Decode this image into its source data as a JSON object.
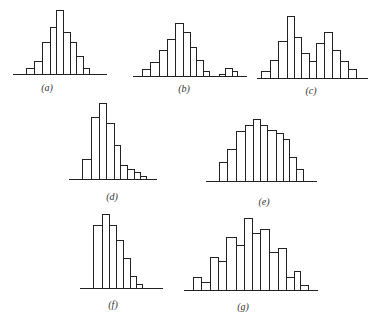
{
  "chart_data": [
    {
      "type": "bar",
      "id": "a",
      "label": "(a)",
      "title": "",
      "xlabel": "",
      "ylabel": "",
      "grid": false,
      "values": [
        6,
        13,
        32,
        47,
        64,
        42,
        32,
        18,
        6
      ],
      "edges": [
        26,
        34,
        42,
        50,
        56,
        63,
        70,
        76,
        83,
        89
      ],
      "baseline_y": 74,
      "axis_x": [
        13,
        107
      ],
      "label_pos": [
        47,
        82
      ]
    },
    {
      "type": "bar",
      "id": "b",
      "label": "(b)",
      "title": "",
      "xlabel": "",
      "ylabel": "",
      "grid": false,
      "values": [
        7,
        14,
        26,
        37,
        53,
        44,
        29,
        16,
        5,
        0,
        0,
        2,
        8,
        5
      ],
      "edges": [
        142,
        150,
        159,
        167,
        175,
        183,
        190,
        196,
        203,
        209
      ],
      "extra_edges": [
        219,
        225,
        232,
        237
      ],
      "extra_values": [
        2,
        8,
        5
      ],
      "baseline_y": 76,
      "axis_x": [
        133,
        247
      ],
      "label_pos": [
        184,
        83
      ]
    },
    {
      "type": "bar",
      "id": "c",
      "label": "(c)",
      "title": "",
      "xlabel": "",
      "ylabel": "",
      "grid": false,
      "values": [
        7,
        18,
        37,
        62,
        41,
        25,
        17,
        35,
        46,
        28,
        17,
        9
      ],
      "edges": [
        261,
        270,
        278,
        287,
        294,
        301,
        309,
        316,
        324,
        332,
        340,
        348,
        356
      ],
      "baseline_y": 78,
      "axis_x": [
        257,
        368
      ],
      "label_pos": [
        311,
        85
      ]
    },
    {
      "type": "bar",
      "id": "d",
      "label": "(d)",
      "title": "",
      "xlabel": "",
      "ylabel": "",
      "grid": false,
      "values": [
        20,
        62,
        76,
        56,
        34,
        14,
        10,
        7,
        3
      ],
      "edges": [
        82,
        91,
        99,
        106,
        114,
        120,
        127,
        134,
        140,
        146
      ],
      "baseline_y": 179,
      "axis_x": [
        69,
        157
      ],
      "label_pos": [
        112,
        191
      ]
    },
    {
      "type": "bar",
      "id": "e",
      "label": "(e)",
      "title": "",
      "xlabel": "",
      "ylabel": "",
      "grid": false,
      "values": [
        19,
        32,
        50,
        56,
        62,
        56,
        51,
        48,
        42,
        24,
        12
      ],
      "edges": [
        219,
        227,
        236,
        245,
        253,
        260,
        267,
        276,
        283,
        289,
        296,
        303
      ],
      "baseline_y": 181,
      "axis_x": [
        206,
        317
      ],
      "label_pos": [
        264,
        196
      ]
    },
    {
      "type": "bar",
      "id": "f",
      "label": "(f)",
      "title": "",
      "xlabel": "",
      "ylabel": "",
      "grid": false,
      "values": [
        63,
        74,
        63,
        48,
        30,
        12,
        4
      ],
      "edges": [
        93,
        102,
        109,
        116,
        123,
        130,
        136,
        142
      ],
      "baseline_y": 288,
      "axis_x": [
        80,
        163
      ],
      "label_pos": [
        113,
        299
      ]
    },
    {
      "type": "bar",
      "id": "g",
      "label": "(g)",
      "title": "",
      "xlabel": "",
      "ylabel": "",
      "grid": false,
      "values": [
        13,
        8,
        33,
        29,
        53,
        45,
        72,
        57,
        61,
        38,
        42,
        13,
        19,
        5
      ],
      "edges": [
        193,
        201,
        210,
        218,
        226,
        236,
        244,
        252,
        260,
        269,
        278,
        286,
        294,
        300,
        308
      ],
      "baseline_y": 290,
      "axis_x": [
        184,
        318
      ],
      "label_pos": [
        243,
        301
      ]
    }
  ],
  "colors": {
    "stroke": "#222222",
    "fill": "#ffffff",
    "background": "#ffffff"
  }
}
